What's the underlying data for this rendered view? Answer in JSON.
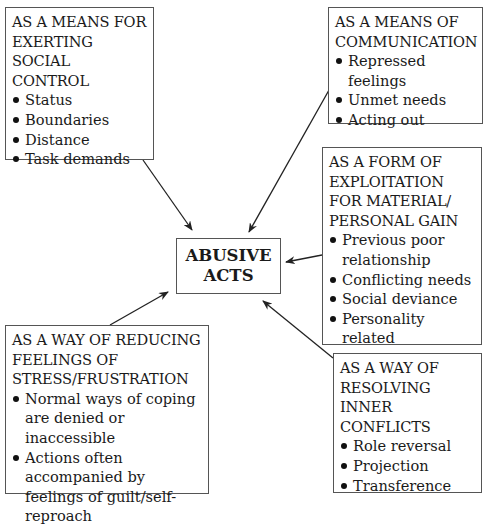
{
  "center": {
    "line1": "ABUSIVE",
    "line2": "ACTS"
  },
  "boxes": {
    "social_control": {
      "title": "AS A MEANS FOR EXERTING SOCIAL CONTROL",
      "items": [
        "Status",
        "Boundaries",
        "Distance",
        "Task demands"
      ]
    },
    "communication": {
      "title": "AS A MEANS OF COMMUNICATION",
      "items": [
        "Repressed feelings",
        "Unmet needs",
        "Acting out"
      ]
    },
    "exploitation": {
      "title": "AS A FORM OF EXPLOITATION FOR MATERIAL/ PERSONAL GAIN",
      "items": [
        "Previous poor relationship",
        "Conflicting needs",
        "Social deviance",
        "Personality related"
      ]
    },
    "stress": {
      "title": "AS A WAY OF REDUCING FEELINGS OF STRESS/FRUSTRATION",
      "items": [
        "Normal ways of coping are denied or inaccessible",
        "Actions often accompanied by feelings of guilt/self-reproach"
      ]
    },
    "inner_conflicts": {
      "title": "AS A WAY OF RESOLVING INNER CONFLICTS",
      "items": [
        "Role reversal",
        "Projection",
        "Transference"
      ]
    }
  }
}
